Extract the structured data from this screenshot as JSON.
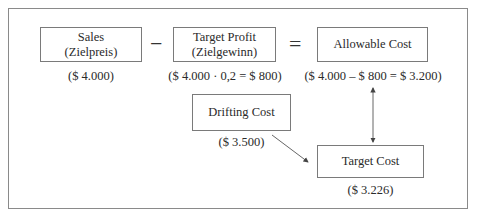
{
  "diagram": {
    "nodes": [
      {
        "id": "sales",
        "line1": "Sales",
        "line2": "(Zielpreis)",
        "value": "($ 4.000)"
      },
      {
        "id": "target_profit",
        "line1": "Target Profit",
        "line2": "(Zielgewinn)",
        "value": "($ 4.000 · 0,2 = $ 800)"
      },
      {
        "id": "allowable_cost",
        "line1": "Allowable Cost",
        "value": "($ 4.000 – $ 800 = $ 3.200)"
      },
      {
        "id": "drifting_cost",
        "line1": "Drifting Cost",
        "value": "($ 3.500)"
      },
      {
        "id": "target_cost",
        "line1": "Target Cost",
        "value": "($ 3.226)"
      }
    ],
    "operators": {
      "minus": "−",
      "equals": "="
    },
    "edges": [
      {
        "from": "drifting_cost",
        "to": "target_cost",
        "type": "arrow"
      },
      {
        "from": "allowable_cost",
        "to": "target_cost",
        "type": "double-arrow"
      }
    ],
    "colors": {
      "line": "#555555",
      "border": "#7a7a7a",
      "text": "#2a2a2a"
    }
  }
}
